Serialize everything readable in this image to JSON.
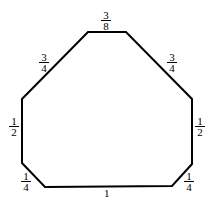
{
  "diagram": {
    "shape": "octagon",
    "stroke_color": "#000000",
    "vertices": [
      [
        88,
        32
      ],
      [
        126,
        32
      ],
      [
        192,
        99
      ],
      [
        192,
        164
      ],
      [
        172,
        186
      ],
      [
        45,
        187
      ],
      [
        22,
        163
      ],
      [
        22,
        99
      ]
    ],
    "edges": [
      {
        "id": "top",
        "num": "3",
        "den": "8"
      },
      {
        "id": "upper-right",
        "num": "3",
        "den": "4"
      },
      {
        "id": "right",
        "num": "1",
        "den": "2"
      },
      {
        "id": "lower-right",
        "num": "1",
        "den": "4"
      },
      {
        "id": "bottom",
        "label": "1"
      },
      {
        "id": "lower-left",
        "num": "1",
        "den": "4"
      },
      {
        "id": "left",
        "num": "1",
        "den": "2"
      },
      {
        "id": "upper-left",
        "num": "3",
        "den": "4"
      }
    ]
  }
}
